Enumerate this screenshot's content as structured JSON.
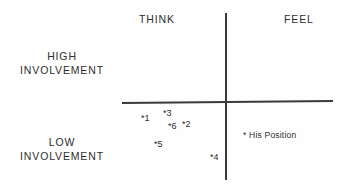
{
  "figure": {
    "type": "scatter",
    "background_color": "#fefefe",
    "line_color": "#3a3a3a",
    "text_color": "#2e2e2e"
  },
  "axes": {
    "horizontal": {
      "name": "involvement-divider"
    },
    "vertical": {
      "name": "think-feel-divider"
    }
  },
  "quadrant_labels": {
    "think": "THINK",
    "feel": "FEEL"
  },
  "side_labels": {
    "high": "HIGH\nINVOLVEMENT",
    "high_line1": "HIGH",
    "high_line2": "INVOLVEMENT",
    "low_line1": "LOW",
    "low_line2": "INVOLVEMENT"
  },
  "legend": {
    "marker": "*",
    "text": "* His Position"
  },
  "chart_data": {
    "type": "scatter",
    "title": "",
    "xlabel": "",
    "ylabel": "",
    "xlim": [
      0,
      1
    ],
    "ylim": [
      0,
      1
    ],
    "grid": false,
    "legend_position": "inside-lower-right",
    "axis_labels": {
      "x_left": "THINK",
      "x_right": "FEEL",
      "y_top": "HIGH INVOLVEMENT",
      "y_bottom": "LOW INVOLVEMENT"
    },
    "marker_style": "asterisk",
    "points": [
      {
        "label": "*1",
        "id": "1",
        "x_px": 141,
        "y_px": 114,
        "quadrant": "think / low involvement"
      },
      {
        "label": "*2",
        "id": "2",
        "x_px": 182,
        "y_px": 120,
        "quadrant": "think / low involvement"
      },
      {
        "label": "*3",
        "id": "3",
        "x_px": 163,
        "y_px": 109,
        "quadrant": "think / low involvement"
      },
      {
        "label": "*4",
        "id": "4",
        "x_px": 210,
        "y_px": 153,
        "quadrant": "think / low involvement"
      },
      {
        "label": "*5",
        "id": "5",
        "x_px": 154,
        "y_px": 140,
        "quadrant": "think / low involvement"
      },
      {
        "label": "*6",
        "id": "6",
        "x_px": 168,
        "y_px": 122,
        "quadrant": "think / low involvement"
      }
    ]
  }
}
